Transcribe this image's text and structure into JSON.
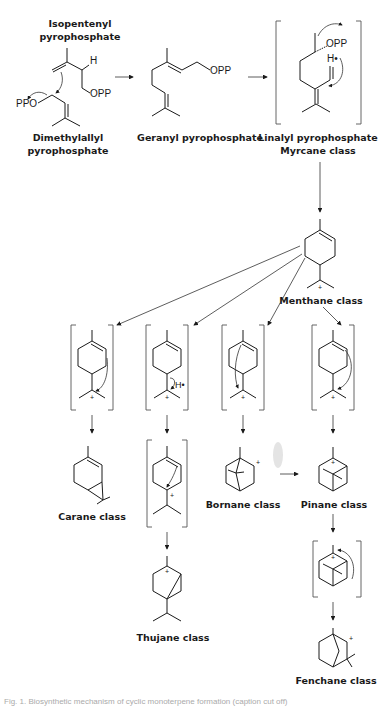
{
  "diagram": {
    "compounds": {
      "ipp": {
        "line1": "Isopentenyl",
        "line2": "pyrophosphate"
      },
      "dmapp": {
        "line1": "Dimethylallyl",
        "line2": "pyrophosphate"
      },
      "gpp": {
        "label": "Geranyl pyrophosphate"
      },
      "lpp": {
        "line1": "Linalyl pyrophosphate",
        "line2": "Myrcane class"
      },
      "menthane": {
        "label": "Menthane class"
      },
      "carane": {
        "label": "Carane class"
      },
      "thujane": {
        "label": "Thujane class"
      },
      "bornane": {
        "label": "Bornane class"
      },
      "pinane": {
        "label": "Pinane class"
      },
      "fenchane": {
        "label": "Fenchane class"
      }
    },
    "atoms": {
      "h": "H",
      "opp": "OPP",
      "ppo": "PPO",
      "h_dot": "H•",
      "plus": "+"
    },
    "caption": "Fig. 1. Biosynthetic mechanism of cyclic monoterpene formation (caption cut off)"
  }
}
